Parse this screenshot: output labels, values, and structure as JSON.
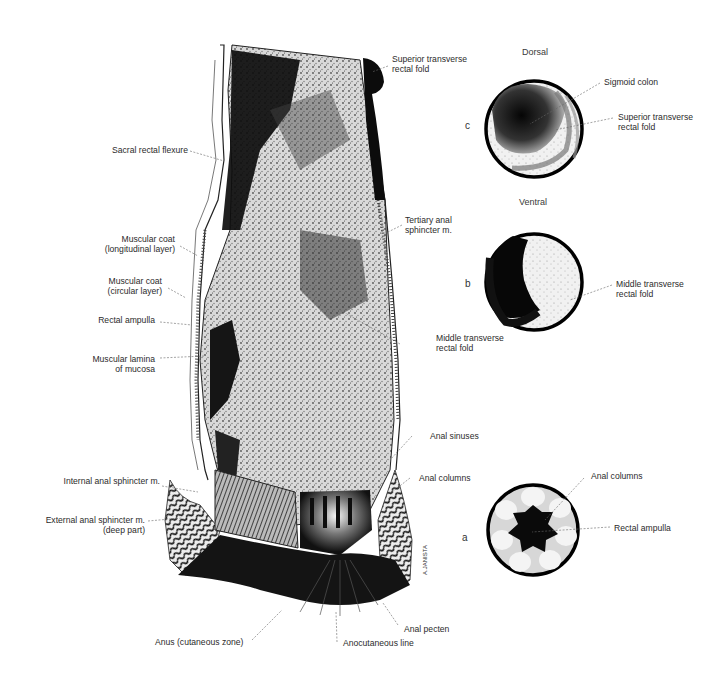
{
  "figure": {
    "main_view": {
      "labels_left": [
        {
          "id": "sacral-rectal-flexure",
          "lines": [
            "Sacral rectal flexure"
          ]
        },
        {
          "id": "muscular-coat-longitudinal",
          "lines": [
            "Muscular coat",
            "(longitudinal layer)"
          ]
        },
        {
          "id": "muscular-coat-circular",
          "lines": [
            "Muscular coat",
            "(circular layer)"
          ]
        },
        {
          "id": "rectal-ampulla",
          "lines": [
            "Rectal ampulla"
          ]
        },
        {
          "id": "muscular-lamina-mucosa",
          "lines": [
            "Muscular lamina",
            "of mucosa"
          ]
        },
        {
          "id": "internal-anal-sphincter",
          "lines": [
            "Internal anal sphincter m."
          ]
        },
        {
          "id": "external-anal-sphincter",
          "lines": [
            "External anal sphincter m.",
            "(deep part)"
          ]
        }
      ],
      "labels_right": [
        {
          "id": "superior-transverse-rectal-fold",
          "lines": [
            "Superior transverse",
            "rectal fold"
          ]
        },
        {
          "id": "tertiary-anal-sphincter",
          "lines": [
            "Tertiary anal",
            "sphincter m."
          ]
        },
        {
          "id": "middle-transverse-rectal-fold",
          "lines": [
            "Middle transverse",
            "rectal fold"
          ]
        },
        {
          "id": "anal-sinuses",
          "lines": [
            "Anal sinuses"
          ]
        },
        {
          "id": "anal-columns",
          "lines": [
            "Anal columns"
          ]
        }
      ],
      "labels_bottom": [
        {
          "id": "anus-cutaneous-zone",
          "lines": [
            "Anus (cutaneous zone)"
          ]
        },
        {
          "id": "anocutaneous-line",
          "lines": [
            "Anocutaneous line"
          ]
        },
        {
          "id": "anal-pecten",
          "lines": [
            "Anal pecten"
          ]
        }
      ],
      "signature": "A.JANISTA"
    },
    "endoscopic_views": {
      "headings": {
        "dorsal": "Dorsal",
        "ventral": "Ventral"
      },
      "c": {
        "letter": "c",
        "labels": [
          {
            "id": "sigmoid-colon",
            "lines": [
              "Sigmoid colon"
            ]
          },
          {
            "id": "superior-transverse-rectal-fold-c",
            "lines": [
              "Superior transverse",
              "rectal fold"
            ]
          }
        ]
      },
      "b": {
        "letter": "b",
        "labels": [
          {
            "id": "middle-transverse-rectal-fold-b",
            "lines": [
              "Middle transverse",
              "rectal fold"
            ]
          }
        ]
      },
      "a": {
        "letter": "a",
        "labels": [
          {
            "id": "anal-columns-a",
            "lines": [
              "Anal columns"
            ]
          },
          {
            "id": "rectal-ampulla-a",
            "lines": [
              "Rectal ampulla"
            ]
          }
        ]
      }
    },
    "colors": {
      "ink": "#111111",
      "mid": "#6e6e6e",
      "paper": "#ffffff",
      "text": "#2b2b2b"
    }
  }
}
